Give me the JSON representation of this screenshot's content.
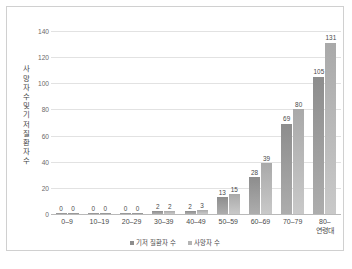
{
  "chart_data": {
    "type": "bar",
    "title": "",
    "subtitle": "",
    "xlabel": "",
    "ylabel": "사망자 수 및 기저질환자 수",
    "ylabel_chars": "사\n망\n자\n수\n및\n기\n저\n질\n환\n자\n수",
    "categories": [
      "0–9",
      "10–19",
      "20–29",
      "30–39",
      "40–49",
      "50–59",
      "60–69",
      "70–79",
      "80–\n연령대"
    ],
    "categories_display": [
      "0–9",
      "10–19",
      "20–29",
      "30–39",
      "40–49",
      "50–59",
      "60–69",
      "70–79",
      "80–"
    ],
    "last_category_second_line": "연령대",
    "series": [
      {
        "name": "기저 질환자 수",
        "color": "#8d8d8d",
        "values": [
          0,
          0,
          0,
          2,
          2,
          13,
          28,
          69,
          105
        ]
      },
      {
        "name": "사망자 수",
        "color": "#b4b4b4",
        "values": [
          0,
          0,
          0,
          2,
          3,
          15,
          39,
          80,
          131
        ]
      }
    ],
    "ylim": [
      0,
      140
    ],
    "yticks": [
      0,
      20,
      40,
      60,
      80,
      100,
      120,
      140
    ],
    "ytick_labels": [
      "0",
      "20",
      "40",
      "60",
      "80",
      "100",
      "120",
      "140"
    ],
    "grid": true,
    "grid_axis": "y",
    "legend_position": "bottom",
    "data_labels": true
  },
  "legend": {
    "items": [
      {
        "label": "기저 질환자 수",
        "color": "#8d8d8d"
      },
      {
        "label": "사망자 수",
        "color": "#b4b4b4"
      }
    ]
  },
  "caption": {
    "text": ""
  },
  "colors": {
    "series_0": "#8d8d8d",
    "series_1": "#b4b4b4",
    "grid": "#e2e2e2",
    "axis": "#b9b9b9",
    "frame": "#d0d0d0",
    "text": "#4a4a4a",
    "background": "#ffffff"
  }
}
